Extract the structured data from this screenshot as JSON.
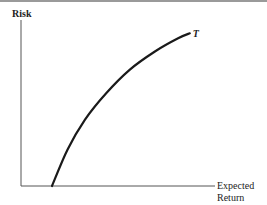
{
  "chart_data": {
    "type": "line",
    "title": "",
    "xlabel": "Expected Return",
    "xlabel_lines": [
      "Expected",
      "Return"
    ],
    "ylabel": "Risk",
    "xlim": [
      0,
      1
    ],
    "ylim": [
      0,
      1
    ],
    "grid": false,
    "legend": "none",
    "ticks": {
      "x": [],
      "y": []
    },
    "series": [
      {
        "name": "T",
        "label": "T",
        "color": "#1a1a1a",
        "x": [
          0.16,
          0.24,
          0.33,
          0.44,
          0.56,
          0.69,
          0.81,
          0.87
        ],
        "y": [
          0.0,
          0.22,
          0.4,
          0.56,
          0.7,
          0.81,
          0.89,
          0.92
        ]
      }
    ]
  },
  "colors": {
    "axis": "#555555",
    "curve": "#1a1a1a",
    "top_rule": "#9a9a9a"
  }
}
